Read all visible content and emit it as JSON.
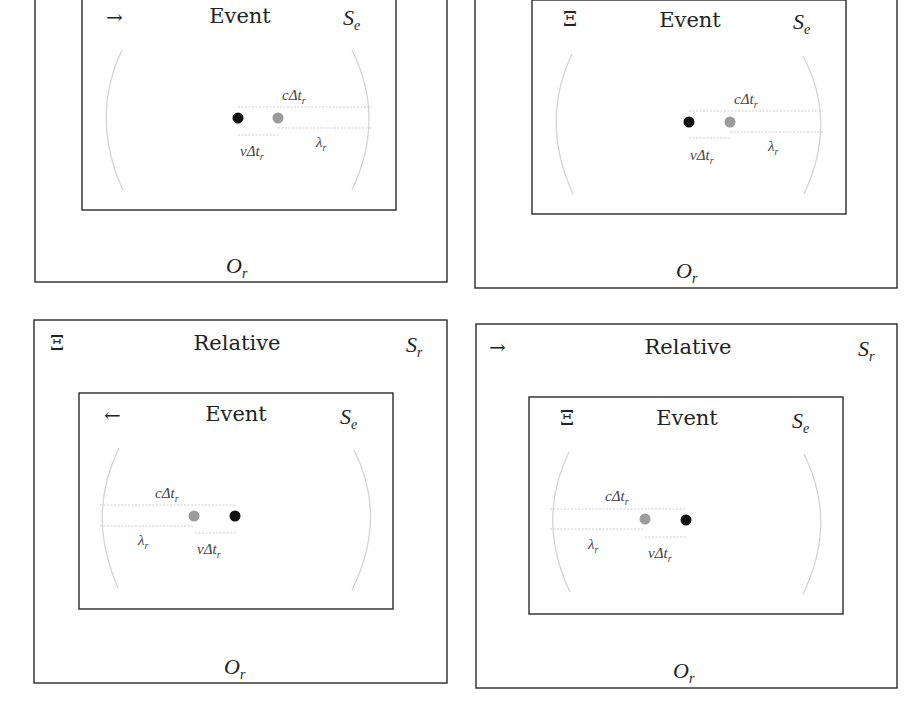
{
  "figure": {
    "panels": [
      {
        "id": "top-left",
        "outer": {
          "title": "",
          "glyph": "",
          "frame_label": "",
          "observer": "O",
          "observer_sub": "r"
        },
        "inner": {
          "title": "Event",
          "glyph": "→",
          "glyph_name": "arrow-right-icon",
          "frame_label": "S",
          "frame_sub": "e"
        },
        "labels": {
          "c_dt": "cΔt",
          "c_dt_sub": "r",
          "v_dt": "vΔt",
          "v_dt_sub": "r",
          "lambda": "λ",
          "lambda_sub": "r"
        }
      },
      {
        "id": "top-right",
        "outer": {
          "title": "",
          "glyph": "",
          "frame_label": "",
          "observer": "O",
          "observer_sub": "r"
        },
        "inner": {
          "title": "Event",
          "glyph": "Ξ",
          "glyph_name": "xi-stationary-icon",
          "frame_label": "S",
          "frame_sub": "e"
        },
        "labels": {
          "c_dt": "cΔt",
          "c_dt_sub": "r",
          "v_dt": "vΔt",
          "v_dt_sub": "r",
          "lambda": "λ",
          "lambda_sub": "r"
        }
      },
      {
        "id": "bottom-left",
        "outer": {
          "title": "Relative",
          "glyph": "Ξ",
          "glyph_name": "xi-stationary-icon",
          "frame_label": "S",
          "frame_sub": "r",
          "observer": "O",
          "observer_sub": "r"
        },
        "inner": {
          "title": "Event",
          "glyph": "←",
          "glyph_name": "arrow-left-icon",
          "frame_label": "S",
          "frame_sub": "e"
        },
        "labels": {
          "c_dt": "cΔt",
          "c_dt_sub": "r",
          "v_dt": "vΔt",
          "v_dt_sub": "r",
          "lambda": "λ",
          "lambda_sub": "r"
        }
      },
      {
        "id": "bottom-right",
        "outer": {
          "title": "Relative",
          "glyph": "→",
          "glyph_name": "arrow-right-icon",
          "frame_label": "S",
          "frame_sub": "r",
          "observer": "O",
          "observer_sub": "r"
        },
        "inner": {
          "title": "Event",
          "glyph": "Ξ",
          "glyph_name": "xi-stationary-icon",
          "frame_label": "S",
          "frame_sub": "e"
        },
        "labels": {
          "c_dt": "cΔt",
          "c_dt_sub": "r",
          "v_dt": "vΔt",
          "v_dt_sub": "r",
          "lambda": "λ",
          "lambda_sub": "r"
        }
      }
    ],
    "colors": {
      "border": "#2a2a2a",
      "arc": "#d4d4d4",
      "source_dot": "#111111",
      "emission_dot": "#9b9b9b"
    }
  }
}
